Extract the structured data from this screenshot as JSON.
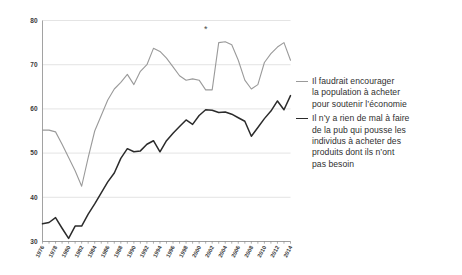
{
  "chart_data": {
    "type": "line",
    "title": "",
    "subtitle": "",
    "xlabel": "",
    "ylabel": "",
    "ylim": [
      30,
      80
    ],
    "ytick_values": [
      30,
      40,
      50,
      60,
      70,
      80
    ],
    "ytick_labels": [
      "30",
      "40",
      "50",
      "60",
      "70",
      "80"
    ],
    "grid": true,
    "grid_axis": "y",
    "legend_position": "right",
    "x": [
      1976,
      1977,
      1978,
      1979,
      1980,
      1981,
      1982,
      1983,
      1984,
      1985,
      1986,
      1987,
      1988,
      1989,
      1990,
      1991,
      1992,
      1993,
      1994,
      1995,
      1996,
      1997,
      1998,
      1999,
      2000,
      2001,
      2002,
      2003,
      2004,
      2005,
      2006,
      2007,
      2008,
      2009,
      2010,
      2011,
      2012,
      2013,
      2014
    ],
    "xtick_labels": [
      "1976",
      "1978",
      "1980",
      "1982",
      "1984",
      "1986",
      "1988",
      "1990",
      "1992",
      "1994",
      "1996",
      "1998",
      "2000",
      "2002",
      "2004",
      "2006",
      "2008",
      "2010",
      "2012",
      "2014"
    ],
    "xtick_values": [
      1976,
      1978,
      1980,
      1982,
      1984,
      1986,
      1988,
      1990,
      1992,
      1994,
      1996,
      1998,
      2000,
      2002,
      2004,
      2006,
      2008,
      2010,
      2012,
      2014
    ],
    "series": [
      {
        "name": "Il faudrait encourager la population à acheter pour soutenir l'économie",
        "color": "#9a9a9a",
        "width": 1.1,
        "values": [
          55.2,
          55.2,
          54.8,
          52.0,
          49.0,
          46.0,
          42.5,
          49.0,
          55.0,
          58.5,
          62.0,
          64.5,
          66.0,
          67.8,
          65.5,
          68.5,
          70.0,
          73.7,
          73.0,
          71.5,
          69.5,
          67.5,
          66.5,
          66.8,
          66.5,
          64.3,
          64.3,
          75.0,
          75.2,
          74.5,
          71.0,
          66.5,
          64.5,
          65.5,
          70.5,
          72.5,
          74.0,
          75.0,
          71.0
        ]
      },
      {
        "name": "Il n'y a rien de mal à faire de la pub qui pousse les individus à acheter des produits dont ils n'ont pas besoin",
        "color": "#2b2b2b",
        "width": 1.5,
        "values": [
          34.0,
          34.3,
          35.4,
          33.0,
          30.7,
          33.5,
          33.5,
          36.2,
          38.5,
          41.0,
          43.5,
          45.5,
          48.8,
          51.0,
          50.3,
          50.5,
          52.0,
          52.8,
          50.3,
          52.8,
          54.5,
          56.0,
          57.5,
          56.5,
          58.5,
          59.8,
          59.7,
          59.2,
          59.3,
          58.8,
          58.0,
          57.2,
          53.8,
          55.8,
          57.8,
          59.5,
          61.8,
          59.8,
          63.0
        ]
      }
    ],
    "annotations": [
      {
        "name": "asterisk-marker",
        "label": "*",
        "x": 2001,
        "y": 77.5
      }
    ]
  },
  "legend": {
    "entries": [
      {
        "swatch": "s1",
        "lines": [
          "Il faudrait encourager",
          "la population à acheter",
          "pour soutenir l’économie"
        ]
      },
      {
        "swatch": "s2",
        "lines": [
          "Il n’y a rien de mal à faire",
          "de la pub qui pousse les",
          "individus à acheter des",
          "produits dont ils n’ont",
          "pas besoin"
        ]
      }
    ]
  }
}
